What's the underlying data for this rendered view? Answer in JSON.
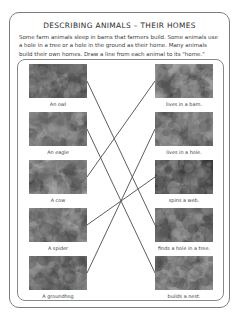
{
  "worksheet": {
    "title": "DESCRIBING ANIMALS – THEIR HOMES",
    "intro": "Some farm animals sleep in barns that farmers build.  Some animals use a hole in a tree or a hole in the ground as their home.  Many animals build their own homes.  Draw a line from each animal to its \"home.\"",
    "instruction_keyword": "Draw a line from each animal to its \"home.\""
  },
  "exercise": {
    "type": "matching",
    "animals": [
      {
        "id": "owl",
        "label": "An owl",
        "image": "owl-photo",
        "top": 4,
        "tone": "#6d6358"
      },
      {
        "id": "eagle",
        "label": "An eagle",
        "image": "eagle-photo",
        "top": 52,
        "tone": "#8a8f7a"
      },
      {
        "id": "cow",
        "label": "A cow",
        "image": "cow-photo",
        "top": 100,
        "tone": "#9aa184"
      },
      {
        "id": "spider",
        "label": "A spider",
        "image": "spider-photo",
        "top": 148,
        "tone": "#8d9486"
      },
      {
        "id": "groundhog",
        "label": "A groundhog",
        "image": "groundhog-photo",
        "top": 196,
        "tone": "#8e7a5c"
      }
    ],
    "homes": [
      {
        "id": "barn",
        "label": "lives in a barn.",
        "image": "barn-photo",
        "top": 4,
        "tone": "#9a9a90"
      },
      {
        "id": "hole_ground",
        "label": "lives in a hole.",
        "image": "burrow-photo",
        "top": 52,
        "tone": "#7e7e6e"
      },
      {
        "id": "web",
        "label": "spins a web.",
        "image": "web-photo",
        "top": 100,
        "tone": "#3a3a3a"
      },
      {
        "id": "tree_hole",
        "label": "finds a hole in a tree.",
        "image": "tree-hole-photo",
        "top": 148,
        "tone": "#6a6258"
      },
      {
        "id": "nest",
        "label": "builds a nest.",
        "image": "nest-photo",
        "top": 196,
        "tone": "#8a7f72"
      }
    ],
    "connections": [
      {
        "from": "owl",
        "to": "tree_hole",
        "x1": 69,
        "y1": 21,
        "x2": 137,
        "y2": 165
      },
      {
        "from": "eagle",
        "to": "nest",
        "x1": 69,
        "y1": 69,
        "x2": 137,
        "y2": 213
      },
      {
        "from": "cow",
        "to": "barn",
        "x1": 69,
        "y1": 117,
        "x2": 137,
        "y2": 21
      },
      {
        "from": "spider",
        "to": "web",
        "x1": 69,
        "y1": 165,
        "x2": 137,
        "y2": 117
      },
      {
        "from": "groundhog",
        "to": "hole_ground",
        "x1": 69,
        "y1": 213,
        "x2": 137,
        "y2": 69
      }
    ],
    "line_color": "#5d5d5d"
  }
}
